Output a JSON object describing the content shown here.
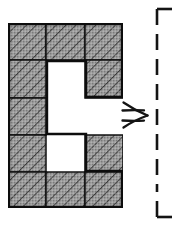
{
  "figure": {
    "background_color": "#ffffff",
    "ink_color": "#1a1a1a"
  },
  "polyomino": {
    "name": "c-shape-polyomino",
    "columns": 3,
    "rows": 5,
    "cell_width": 38,
    "cell_height": 37,
    "origin_x": 8,
    "origin_y": 23,
    "fill_color": "#9a9a9a",
    "hatch_color": "#2b2b2b",
    "outline_color": "#111111",
    "outline_width": 2.2,
    "grid_line_width": 1.4,
    "hatch_angle_deg": 45,
    "cells": [
      {
        "row": 0,
        "col": 0,
        "filled": true,
        "label": "r1c1"
      },
      {
        "row": 0,
        "col": 1,
        "filled": true,
        "label": "r1c2"
      },
      {
        "row": 0,
        "col": 2,
        "filled": true,
        "label": "r1c3"
      },
      {
        "row": 1,
        "col": 0,
        "filled": true,
        "label": "r2c1"
      },
      {
        "row": 1,
        "col": 1,
        "filled": false,
        "label": "r2c2"
      },
      {
        "row": 1,
        "col": 2,
        "filled": true,
        "label": "r2c3"
      },
      {
        "row": 2,
        "col": 0,
        "filled": true,
        "label": "r3c1"
      },
      {
        "row": 2,
        "col": 1,
        "filled": false,
        "label": "r3c2"
      },
      {
        "row": 2,
        "col": 2,
        "filled": false,
        "label": "r3c3"
      },
      {
        "row": 3,
        "col": 0,
        "filled": true,
        "label": "r4c1"
      },
      {
        "row": 3,
        "col": 1,
        "filled": false,
        "label": "r4c2"
      },
      {
        "row": 3,
        "col": 2,
        "filled": true,
        "label": "r4c3"
      },
      {
        "row": 4,
        "col": 0,
        "filled": true,
        "label": "r5c1"
      },
      {
        "row": 4,
        "col": 1,
        "filled": true,
        "label": "r5c2"
      },
      {
        "row": 4,
        "col": 2,
        "filled": true,
        "label": "r5c3"
      }
    ],
    "filled_count": 11,
    "empty_count": 4
  },
  "arrow": {
    "name": "implies-arrow",
    "glyph": "⇒",
    "style": "hand-drawn double stroke",
    "direction": "right",
    "color": "#141414"
  },
  "axis": {
    "name": "vertical-dashed-axis",
    "orientation": "vertical",
    "line_style": "dashed",
    "color": "#141414",
    "stroke_width": 2.4,
    "dash_length": 16,
    "dash_gap": 9,
    "x_position": 157,
    "top_y": 9,
    "bottom_y": 217,
    "top_bracket": "corner-top-right",
    "bottom_bracket": "corner-bottom-right",
    "bracket_arm_length": 16
  }
}
